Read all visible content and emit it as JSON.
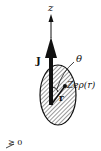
{
  "diagram": {
    "type": "nuclear-charge-distribution",
    "labels": {
      "z_axis": "z",
      "angular_momentum": "J",
      "angle": "θ",
      "charge_density": "Zeρ(r)",
      "position_vector": "r",
      "partial_bottom": "≥ 0"
    },
    "colors": {
      "ink": "#111111",
      "background": "#ffffff",
      "hatch": "#333333"
    }
  }
}
